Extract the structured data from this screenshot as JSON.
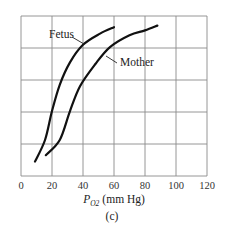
{
  "chart_data": {
    "type": "line",
    "title": "",
    "panel_label": "(c)",
    "xlabel": "P_O2 (mm Hg)",
    "xlabel_parts": {
      "symbol": "P",
      "subscript": "O2",
      "units": "(mm Hg)"
    },
    "ylabel": "",
    "xlim": [
      0,
      120
    ],
    "ylim": [
      0,
      100
    ],
    "xticks": [
      0,
      20,
      40,
      60,
      80,
      100,
      120
    ],
    "yticks": [
      0,
      20,
      40,
      60,
      80,
      100
    ],
    "ytick_labels_shown": false,
    "grid": true,
    "legend": "inline labels",
    "series": [
      {
        "name": "Fetus",
        "x": [
          9,
          15.5,
          20,
          25,
          31.6,
          40,
          51,
          60
        ],
        "y": [
          9,
          22.5,
          40.6,
          57,
          71,
          82,
          89,
          93
        ],
        "label_pos": {
          "px": 49,
          "py": 38
        },
        "leader": [
          72,
          37,
          84,
          44
        ]
      },
      {
        "name": "Mother",
        "x": [
          16,
          25,
          31.6,
          38,
          48,
          57.4,
          70,
          80,
          88
        ],
        "y": [
          13,
          22.5,
          40.6,
          56,
          70,
          80.6,
          88,
          91,
          94
        ],
        "label_pos": {
          "px": 120,
          "py": 66
        },
        "leader": [
          106,
          56,
          117,
          63
        ]
      }
    ]
  },
  "layout": {
    "plot": {
      "left": 21,
      "top": 16,
      "right": 207,
      "bottom": 176
    }
  }
}
